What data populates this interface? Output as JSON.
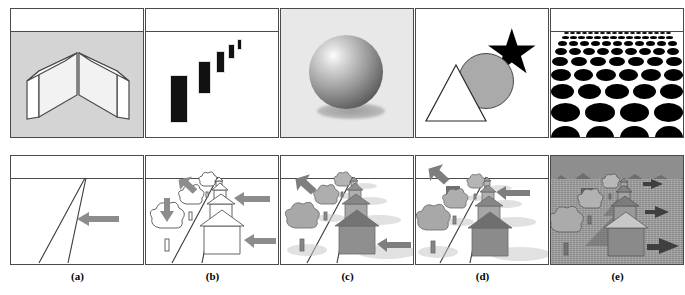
{
  "figure": {
    "panel_count": 5,
    "row_count": 2,
    "labels": [
      "(a)",
      "(b)",
      "(c)",
      "(d)",
      "(e)"
    ],
    "colors": {
      "border": "#4a4a4a",
      "ground_gray": "#d4d4d4",
      "black": "#000000",
      "shape_gray": "#aaaaaa",
      "arrow_gray": "#8c8c8c",
      "scene_gray": "#9c9c9c",
      "white": "#ffffff"
    }
  },
  "top_row": {
    "panels": [
      {
        "id": "a",
        "cue_name": "linear-perspective",
        "background": "#d4d4d4",
        "has_horizon": true,
        "shapes": "two-converging-slabs"
      },
      {
        "id": "b",
        "cue_name": "relative-size-gradient",
        "background": "#ffffff",
        "has_horizon": true,
        "shapes": "five-diminishing-black-bars",
        "bar_count": 5
      },
      {
        "id": "c",
        "cue_name": "shading-and-shadow",
        "background": "#e8e8e8",
        "has_horizon": false,
        "shapes": "shaded-sphere-with-cast-shadow"
      },
      {
        "id": "d",
        "cue_name": "occlusion-interposition",
        "background": "#ffffff",
        "has_horizon": false,
        "shapes": "triangle-circle-star-overlap"
      },
      {
        "id": "e",
        "cue_name": "texture-gradient",
        "background": "#ffffff",
        "has_horizon": true,
        "shapes": "ellipse-texture-gradient",
        "texture_rows": 9
      }
    ]
  },
  "bottom_row": {
    "panels": [
      {
        "id": "a",
        "scene_name": "perspective-lines-only",
        "background": "#ffffff",
        "elements": "two-converging-lines",
        "arrow_count": 1
      },
      {
        "id": "b",
        "scene_name": "outline-houses-and-trees",
        "background": "#ffffff",
        "elements": "outlined-houses-trees-on-perspective-lines",
        "arrow_count": 4,
        "house_count": 4,
        "tree_count": 3
      },
      {
        "id": "c",
        "scene_name": "shaded-houses-and-trees",
        "background": "#ffffff",
        "elements": "shaded-houses-trees-with-shadows",
        "arrow_count": 2,
        "house_count": 4,
        "tree_count": 4
      },
      {
        "id": "d",
        "scene_name": "occluded-houses-and-trees",
        "background": "#ffffff",
        "elements": "overlapping-shaded-houses-and-trees",
        "arrow_count": 2,
        "house_count": 4,
        "tree_count": 4
      },
      {
        "id": "e",
        "scene_name": "full-textured-scene",
        "background": "#9c9c9c",
        "elements": "textured-ground-mountains-houses-trees",
        "arrow_count": 3,
        "house_count": 4,
        "tree_count": 4
      }
    ]
  }
}
